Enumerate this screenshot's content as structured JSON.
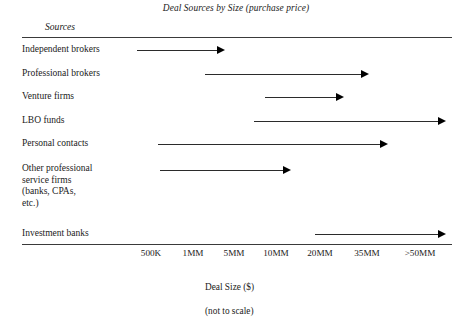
{
  "chart_data": {
    "type": "bar",
    "title": "Deal Sources by Size (purchase price)",
    "xlabel": "Deal Size ($)",
    "xlabel_note": "(not to scale)",
    "ylabel": "Sources",
    "grid": false,
    "legend": "none",
    "x_tick_labels": [
      "500K",
      "1MM",
      "5MM",
      "10MM",
      "20MM",
      "35MM",
      ">50MM"
    ],
    "x_tick_positions_px": [
      151,
      193,
      234,
      276,
      320,
      367,
      420
    ],
    "categories": [
      "Independent brokers",
      "Professional brokers",
      "Venture firms",
      "LBO funds",
      "Personal contacts",
      "Other professional\nservice firms\n(banks, CPAs,\netc.)",
      "Investment banks"
    ],
    "series": [
      {
        "name": "Deal size range",
        "ranges": [
          {
            "category": "Independent brokers",
            "from": "500K",
            "to": "5MM"
          },
          {
            "category": "Professional brokers",
            "from": "1MM",
            "to": "35MM"
          },
          {
            "category": "Venture firms",
            "from": "10MM",
            "to": "20MM"
          },
          {
            "category": "LBO funds",
            "from": "5MM",
            "to": ">50MM"
          },
          {
            "category": "Personal contacts",
            "from": "500K",
            "to": "35MM"
          },
          {
            "category": "Other professional service firms",
            "from": "500K",
            "to": "10MM"
          },
          {
            "category": "Investment banks",
            "from": "20MM",
            "to": ">50MM"
          }
        ]
      }
    ]
  },
  "figure": {
    "title": "Deal Sources by Size (purchase price)",
    "sources_heading": "Sources",
    "axis_caption_line1": "Deal Size ($)",
    "axis_caption_line2": "(not to scale)",
    "colors": {
      "rule": "#3a3a3a",
      "arrow": "#2b2b2b",
      "text": "#1a1a1a",
      "background": "#ffffff"
    },
    "rows": [
      {
        "label": "Independent brokers",
        "y": 50,
        "arrow_start": 137,
        "arrow_end": 225
      },
      {
        "label": "Professional brokers",
        "y": 74,
        "arrow_start": 205,
        "arrow_end": 369
      },
      {
        "label": "Venture firms",
        "y": 97,
        "arrow_start": 265,
        "arrow_end": 344
      },
      {
        "label": "LBO funds",
        "y": 121,
        "arrow_start": 254,
        "arrow_end": 446
      },
      {
        "label": "Personal contacts",
        "y": 144,
        "arrow_start": 158,
        "arrow_end": 388
      },
      {
        "label": "Other professional\n   service firms\n   (banks, CPAs,\n   etc.)",
        "y": 170,
        "arrow_start": 160,
        "arrow_end": 291
      },
      {
        "label": "Investment banks",
        "y": 234,
        "arrow_start": 315,
        "arrow_end": 446
      }
    ],
    "ticks": [
      {
        "label": "500K",
        "x": 151
      },
      {
        "label": "1MM",
        "x": 193
      },
      {
        "label": "5MM",
        "x": 234
      },
      {
        "label": "10MM",
        "x": 276
      },
      {
        "label": "20MM",
        "x": 320
      },
      {
        "label": "35MM",
        "x": 367
      },
      {
        "label": ">50MM",
        "x": 420
      }
    ]
  }
}
